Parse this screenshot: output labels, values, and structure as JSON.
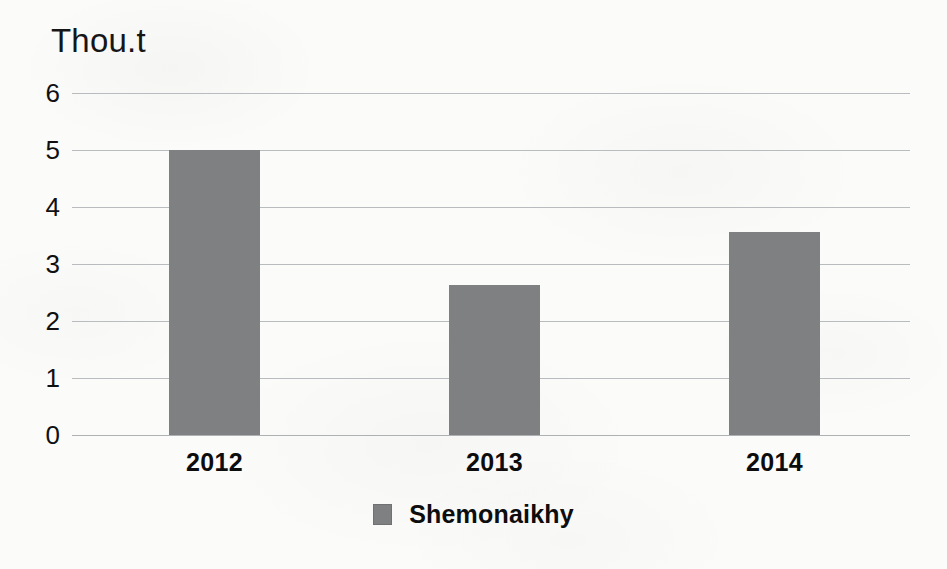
{
  "chart_data": {
    "type": "bar",
    "title": "Thou.t",
    "xlabel": "",
    "ylabel": "Thou.t",
    "categories": [
      "2012",
      "2013",
      "2014"
    ],
    "series": [
      {
        "name": "Shemonaikhy",
        "color": "#7f8082",
        "values": [
          5.0,
          2.63,
          3.56
        ]
      }
    ],
    "ylim": [
      0,
      6
    ],
    "yticks": [
      0,
      1,
      2,
      3,
      4,
      5,
      6
    ],
    "ytick_labels": [
      "0",
      "1",
      "2",
      "3",
      "4",
      "5",
      "6"
    ],
    "grid": true,
    "grid_axis": "y",
    "legend": {
      "position": "bottom",
      "entries": [
        {
          "label": "Shemonaikhy",
          "swatch_name": "legend-swatch-shemonaikhy"
        }
      ]
    }
  },
  "colors": {
    "bar": "#7f8082",
    "gridline": "#b9bcbe",
    "text": "#0d0d0d",
    "background": "#fbfbfa"
  }
}
